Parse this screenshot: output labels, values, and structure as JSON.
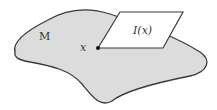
{
  "diagram": {
    "manifold_label": "M",
    "point_label": "x",
    "plane_label": "I(x)",
    "colors": {
      "manifold_fill": "#dcdcdc",
      "outline": "#3a3a3a",
      "plane_fill": "#ffffff",
      "point": "#111111"
    }
  }
}
